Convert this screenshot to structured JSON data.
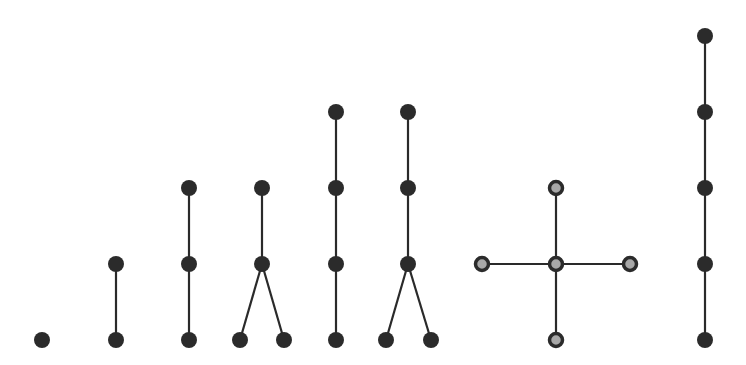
{
  "diagram": {
    "type": "tree-graphs",
    "colors": {
      "node": "#2b2b2b",
      "edge": "#2a2a2a",
      "node_highlight_fill": "#a8a8a8",
      "background": "#ffffff"
    },
    "node_radius": 8,
    "trees": [
      {
        "id": "t1",
        "nodes": [
          [
            42,
            340
          ]
        ],
        "edges": [],
        "style": "dark"
      },
      {
        "id": "t2",
        "nodes": [
          [
            116,
            264
          ],
          [
            116,
            340
          ]
        ],
        "edges": [
          [
            0,
            1
          ]
        ],
        "style": "dark"
      },
      {
        "id": "t3",
        "nodes": [
          [
            189,
            188
          ],
          [
            189,
            264
          ],
          [
            189,
            340
          ]
        ],
        "edges": [
          [
            0,
            1
          ],
          [
            1,
            2
          ]
        ],
        "style": "dark"
      },
      {
        "id": "t4",
        "nodes": [
          [
            262,
            188
          ],
          [
            262,
            264
          ],
          [
            240,
            340
          ],
          [
            284,
            340
          ]
        ],
        "edges": [
          [
            0,
            1
          ],
          [
            1,
            2
          ],
          [
            1,
            3
          ]
        ],
        "style": "dark"
      },
      {
        "id": "t5",
        "nodes": [
          [
            336,
            112
          ],
          [
            336,
            188
          ],
          [
            336,
            264
          ],
          [
            336,
            340
          ]
        ],
        "edges": [
          [
            0,
            1
          ],
          [
            1,
            2
          ],
          [
            2,
            3
          ]
        ],
        "style": "dark"
      },
      {
        "id": "t6",
        "nodes": [
          [
            408,
            112
          ],
          [
            408,
            188
          ],
          [
            408,
            264
          ],
          [
            386,
            340
          ],
          [
            431,
            340
          ]
        ],
        "edges": [
          [
            0,
            1
          ],
          [
            1,
            2
          ],
          [
            2,
            3
          ],
          [
            2,
            4
          ]
        ],
        "style": "dark"
      },
      {
        "id": "t7",
        "nodes": [
          [
            556,
            264
          ],
          [
            556,
            188
          ],
          [
            482,
            264
          ],
          [
            630,
            264
          ],
          [
            556,
            340
          ]
        ],
        "edges": [
          [
            0,
            1
          ],
          [
            0,
            2
          ],
          [
            0,
            3
          ],
          [
            0,
            4
          ]
        ],
        "style": "ring"
      },
      {
        "id": "t8",
        "nodes": [
          [
            705,
            36
          ],
          [
            705,
            112
          ],
          [
            705,
            188
          ],
          [
            705,
            264
          ],
          [
            705,
            340
          ]
        ],
        "edges": [
          [
            0,
            1
          ],
          [
            1,
            2
          ],
          [
            2,
            3
          ],
          [
            3,
            4
          ]
        ],
        "style": "dark"
      }
    ]
  }
}
